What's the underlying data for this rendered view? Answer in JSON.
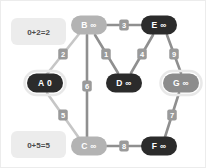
{
  "canvas": {
    "width": 206,
    "height": 168,
    "background": "#ffffff",
    "border_color": "#ececec"
  },
  "palette": {
    "node_dark": "#2b2b2b",
    "node_mid": "#8c8c8c",
    "node_light": "#b3b3b3",
    "node_ring": "#e8e8e8",
    "edge_dim": "#8f8f8f",
    "edge_highlight": "#c6c6c6",
    "edge_label_box": "#9a9a9a",
    "edge_label_text": "#ffffff",
    "callout_bg": "#ececec",
    "callout_text": "#4d4d4d",
    "node_label_light": "#ffffff"
  },
  "diagram": {
    "type": "weighted-graph-dijkstra",
    "nodes": [
      {
        "id": "A",
        "label": "A 0",
        "name": "A",
        "distance": "0",
        "x": 44,
        "y": 82,
        "rx": 18,
        "ry": 9.5,
        "fill": "#2b2b2b",
        "text_color": "#ffffff",
        "ring": true,
        "ring_color": "#e8e8e8",
        "state": "visited-current"
      },
      {
        "id": "B",
        "label": "B ∞",
        "name": "B",
        "distance": "∞",
        "x": 88,
        "y": 24,
        "rx": 18,
        "ry": 9.5,
        "fill": "#b3b3b3",
        "text_color": "#ffffff",
        "ring": false,
        "ring_color": "",
        "state": "frontier"
      },
      {
        "id": "C",
        "label": "C ∞",
        "name": "C",
        "distance": "∞",
        "x": 88,
        "y": 145,
        "rx": 18,
        "ry": 9.5,
        "fill": "#b3b3b3",
        "text_color": "#ffffff",
        "ring": false,
        "ring_color": "",
        "state": "frontier"
      },
      {
        "id": "D",
        "label": "D ∞",
        "name": "D",
        "distance": "∞",
        "x": 123,
        "y": 82,
        "rx": 18,
        "ry": 9.5,
        "fill": "#2b2b2b",
        "text_color": "#ffffff",
        "ring": false,
        "ring_color": "",
        "state": "unvisited"
      },
      {
        "id": "E",
        "label": "E ∞",
        "name": "E",
        "distance": "∞",
        "x": 158,
        "y": 24,
        "rx": 18,
        "ry": 9.5,
        "fill": "#2b2b2b",
        "text_color": "#ffffff",
        "ring": false,
        "ring_color": "",
        "state": "unvisited"
      },
      {
        "id": "F",
        "label": "F ∞",
        "name": "F",
        "distance": "∞",
        "x": 158,
        "y": 145,
        "rx": 18,
        "ry": 9.5,
        "fill": "#2b2b2b",
        "text_color": "#ffffff",
        "ring": false,
        "ring_color": "",
        "state": "unvisited"
      },
      {
        "id": "G",
        "label": "G ∞",
        "name": "G",
        "distance": "∞",
        "x": 180,
        "y": 82,
        "rx": 18,
        "ry": 9.5,
        "fill": "#8c8c8c",
        "text_color": "#ffffff",
        "ring": true,
        "ring_color": "#e8e8e8",
        "state": "unvisited-ringed"
      }
    ],
    "edges": [
      {
        "id": "AB",
        "from": "A",
        "to": "B",
        "weight": "2",
        "x1": 46,
        "y1": 73,
        "x2": 78,
        "y2": 33,
        "lx": 62,
        "ly": 53,
        "color": "#c6c6c6",
        "highlight": true
      },
      {
        "id": "AC",
        "from": "A",
        "to": "C",
        "weight": "5",
        "x1": 46,
        "y1": 92,
        "x2": 78,
        "y2": 137,
        "lx": 62,
        "ly": 114,
        "color": "#c6c6c6",
        "highlight": true
      },
      {
        "id": "BD",
        "from": "B",
        "to": "D",
        "weight": "1",
        "x1": 94,
        "y1": 34,
        "x2": 117,
        "y2": 72,
        "lx": 105,
        "ly": 53,
        "color": "#8f8f8f",
        "highlight": false
      },
      {
        "id": "BC",
        "from": "B",
        "to": "C",
        "weight": "6",
        "x1": 86,
        "y1": 34,
        "x2": 86,
        "y2": 136,
        "lx": 86,
        "ly": 85,
        "color": "#8f8f8f",
        "highlight": false
      },
      {
        "id": "BE",
        "from": "B",
        "to": "E",
        "weight": "3",
        "x1": 106,
        "y1": 24,
        "x2": 140,
        "y2": 24,
        "lx": 123,
        "ly": 24,
        "color": "#8f8f8f",
        "highlight": false
      },
      {
        "id": "ED",
        "from": "E",
        "to": "D",
        "weight": "4",
        "x1": 152,
        "y1": 34,
        "x2": 130,
        "y2": 72,
        "lx": 141,
        "ly": 53,
        "color": "#8f8f8f",
        "highlight": false
      },
      {
        "id": "EG",
        "from": "E",
        "to": "G",
        "weight": "9",
        "x1": 166,
        "y1": 34,
        "x2": 180,
        "y2": 72,
        "lx": 173,
        "ly": 53,
        "color": "#8f8f8f",
        "highlight": false
      },
      {
        "id": "GF",
        "from": "G",
        "to": "F",
        "weight": "7",
        "x1": 178,
        "y1": 92,
        "x2": 164,
        "y2": 136,
        "lx": 171,
        "ly": 114,
        "color": "#8f8f8f",
        "highlight": false
      },
      {
        "id": "CF",
        "from": "C",
        "to": "F",
        "weight": "8",
        "x1": 106,
        "y1": 145,
        "x2": 140,
        "y2": 145,
        "lx": 123,
        "ly": 145,
        "color": "#8f8f8f",
        "highlight": false
      }
    ],
    "callouts": [
      {
        "id": "callout-b",
        "text": "0+2=2",
        "x": 10,
        "y": 17,
        "w": 55,
        "h": 27,
        "tail_x": 65,
        "tail_y": 30,
        "target": "B"
      },
      {
        "id": "callout-c",
        "text": "0+5=5",
        "x": 10,
        "y": 130,
        "w": 55,
        "h": 27,
        "tail_x": 65,
        "tail_y": 143,
        "target": "C"
      }
    ]
  }
}
